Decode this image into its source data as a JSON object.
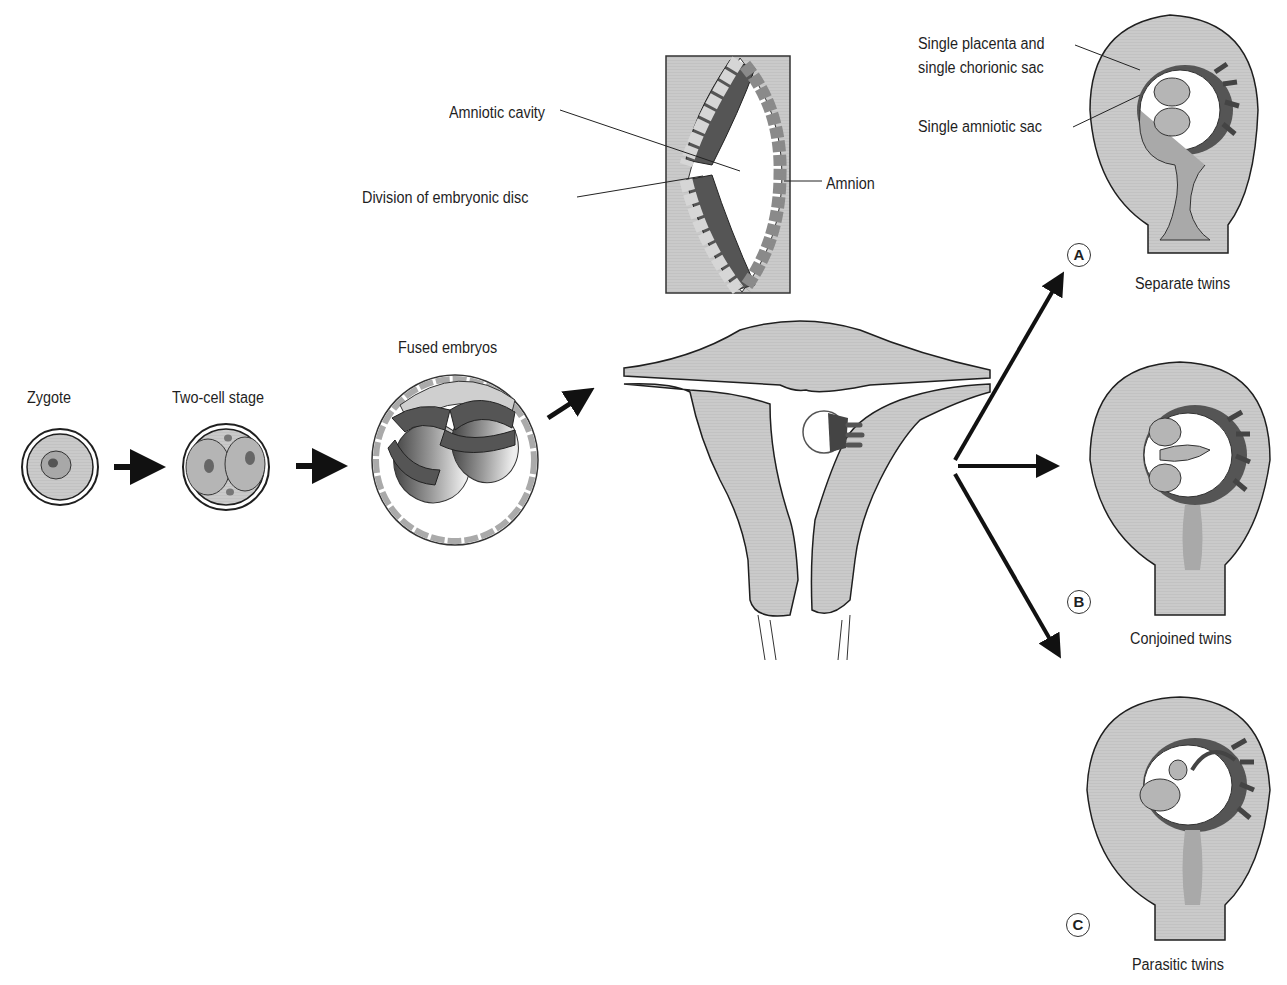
{
  "colors": {
    "tissue": "#c9c9c9",
    "tissue_mid": "#a9a9a9",
    "dark_cell": "#5a5a5a",
    "light_cell": "#d2d2d2",
    "outline": "#1f1f1f",
    "placenta": "#4a4a4a",
    "background": "#ffffff"
  },
  "stages": {
    "zygote": "Zygote",
    "two_cell": "Two-cell stage",
    "fused": "Fused embryos"
  },
  "inset": {
    "amniotic_cavity": "Amniotic cavity",
    "division": "Division of embryonic disc",
    "amnion": "Amnion"
  },
  "outcome_labels": {
    "placenta_line1": "Single placenta and",
    "placenta_line2": "single chorionic sac",
    "amniotic_sac": "Single amniotic sac"
  },
  "outcomes": [
    {
      "letter": "A",
      "label": "Separate twins"
    },
    {
      "letter": "B",
      "label": "Conjoined twins"
    },
    {
      "letter": "C",
      "label": "Parasitic twins"
    }
  ]
}
